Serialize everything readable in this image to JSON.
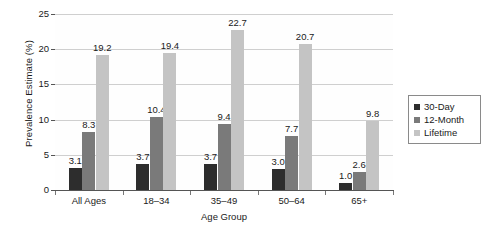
{
  "chart_data": {
    "type": "bar",
    "title": "",
    "subtitle": "",
    "xlabel": "Age Group",
    "ylabel": "Prevalence Estimate (%)",
    "categories": [
      "All Ages",
      "18–34",
      "35–49",
      "50–64",
      "65+"
    ],
    "series": [
      {
        "name": "30-Day",
        "color": "#2d2d2d",
        "values": [
          3.1,
          3.7,
          3.7,
          3.0,
          1.0
        ],
        "labels": [
          "3.1",
          "3.7",
          "3.7",
          "3.0",
          "1.0"
        ]
      },
      {
        "name": "12-Month",
        "color": "#7a7a7a",
        "values": [
          8.3,
          10.4,
          9.4,
          7.7,
          2.6
        ],
        "labels": [
          "8.3",
          "10.4",
          "9.4",
          "7.7",
          "2.6"
        ]
      },
      {
        "name": "Lifetime",
        "color": "#c4c4c4",
        "values": [
          19.2,
          19.4,
          22.7,
          20.7,
          9.8
        ],
        "labels": [
          "19.2",
          "19.4",
          "22.7",
          "20.7",
          "9.8"
        ]
      }
    ],
    "ylim": [
      0,
      25
    ],
    "yticks": [
      0,
      5,
      10,
      15,
      20,
      25
    ],
    "ytick_labels": [
      "0",
      "5",
      "10",
      "15",
      "20",
      "25"
    ],
    "grid": true,
    "grid_axis": "y",
    "legend_position": "right",
    "background_color": "#ffffff",
    "grid_color": "#cfcfcf",
    "axis_color": "#555555"
  },
  "legend": {
    "items": [
      {
        "label": "30-Day",
        "color": "#2d2d2d"
      },
      {
        "label": "12-Month",
        "color": "#7a7a7a"
      },
      {
        "label": "Lifetime",
        "color": "#c4c4c4"
      }
    ]
  }
}
